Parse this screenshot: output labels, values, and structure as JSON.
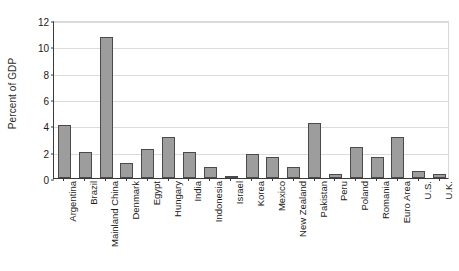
{
  "chart_data": {
    "type": "bar",
    "title": "",
    "subtitle": "",
    "xlabel": "",
    "ylabel": "Percent of GDP",
    "ylim": [
      0,
      12
    ],
    "yticks": [
      0,
      2,
      4,
      6,
      8,
      10,
      12
    ],
    "ytick_labels": [
      "0",
      "2",
      "4",
      "6",
      "8",
      "10",
      "12"
    ],
    "grid": true,
    "legend": false,
    "legend_position": "none",
    "bar_color": "#9d9d9d",
    "bar_edge_color": "#4a4a4a",
    "gridline_color": "#dcdcdc",
    "axis_color": "#3a3a3a",
    "categories": [
      "Argentina",
      "Brazil",
      "Mainland China",
      "Denmark",
      "Egypt",
      "Hungary",
      "India",
      "Indonesia",
      "Israel",
      "Korea",
      "Mexico",
      "New Zealand",
      "Pakistan",
      "Peru",
      "Poland",
      "Romania",
      "Euro Area",
      "U.S.",
      "U.K."
    ],
    "values": [
      4.05,
      1.95,
      10.7,
      1.15,
      2.2,
      3.15,
      1.95,
      0.85,
      0.1,
      1.85,
      1.6,
      0.8,
      4.15,
      0.3,
      2.35,
      1.6,
      3.1,
      0.5,
      0.3
    ]
  }
}
